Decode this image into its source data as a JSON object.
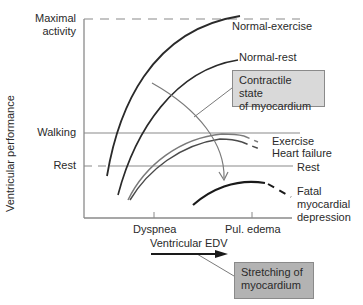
{
  "diagram": {
    "y_axis": {
      "title": "Ventricular performance",
      "levels": [
        {
          "label": "Maximal activity",
          "line1": "Maximal",
          "line2": "activity",
          "style": "dashed"
        },
        {
          "label": "Walking",
          "style": "solid"
        },
        {
          "label": "Rest",
          "style": "dashed"
        }
      ]
    },
    "x_axis": {
      "title": "Ventricular EDV",
      "ticks": [
        "Dyspnea",
        "Pul. edema"
      ]
    },
    "curves": [
      {
        "label": "Normal-exercise"
      },
      {
        "label": "Normal-rest"
      },
      {
        "label": "Exercise"
      },
      {
        "label": "Heart failure"
      },
      {
        "label": "Rest"
      },
      {
        "label": "Fatal",
        "line1": "Fatal",
        "line2": "myocardial",
        "line3": "depression"
      }
    ],
    "boxes": {
      "contractile": {
        "line1": "Contractile state",
        "line2": "of myocardium"
      },
      "stretching": {
        "line1": "Stretching of",
        "line2": "myocardium"
      }
    },
    "colors": {
      "axis": "#8a8a8a",
      "curve_dark": "#2a2a2a",
      "curve_gray": "#7a7a7a",
      "box_light": "#d9d9d9",
      "box_dark": "#b3b3b3"
    }
  }
}
